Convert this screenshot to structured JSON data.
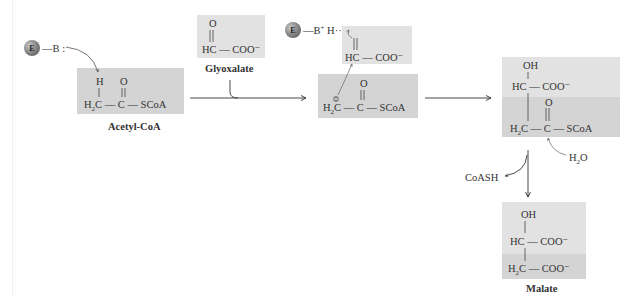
{
  "diagram": {
    "enzyme": {
      "symbol": "E",
      "base": "B",
      "base_lonepair": ":",
      "protonated_base": "B",
      "charge_plus": "+",
      "h_bond": "H···O"
    },
    "molecules": {
      "acetyl_coa": {
        "label": "Acetyl-CoA",
        "top_row": [
          "H",
          "O"
        ],
        "bottom_row": [
          "H2C",
          "C",
          "SCoA"
        ]
      },
      "glyoxalate": {
        "label": "Glyoxalate",
        "top": "O",
        "bottom": "HC — COO⁻"
      },
      "intermediate_glyoxalate": {
        "top": "O",
        "bottom": "HC — COO⁻"
      },
      "enolate": {
        "top": "O",
        "bottom": [
          "H2C",
          "C",
          "SCoA"
        ],
        "charge": "−"
      },
      "malyl_coa": {
        "rows": [
          "OH",
          "HC — COO⁻",
          "O",
          "H2C — C — SCoA"
        ]
      },
      "malate": {
        "label": "Malate",
        "rows": [
          "OH",
          "HC — COO⁻",
          "H2C — COO⁻"
        ]
      }
    },
    "reagents": {
      "water": "H2O",
      "coash": "CoASH"
    },
    "colors": {
      "box_dark": "#d4d4d4",
      "box_light": "#e2e2e2",
      "arrow": "#333333",
      "text": "#333333"
    }
  }
}
